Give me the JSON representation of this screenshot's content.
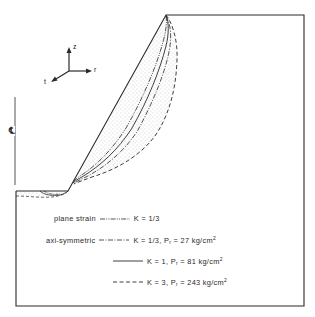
{
  "figure": {
    "type": "cross-section diagram",
    "axes_triad": {
      "z_label": "z",
      "r_label": "r",
      "t_label": "t"
    },
    "centerline_label": "℄",
    "legend": [
      {
        "category": "plane strain",
        "line_style": "dash-dot-dot",
        "k_text": "K = ",
        "k_value": "1/3",
        "pressure_symbol": "",
        "pressure_value": ""
      },
      {
        "category": "axi-symmetric",
        "line_style": "dash-dot",
        "k_text": "K = ",
        "k_value": "1/3",
        "pressure_symbol": "P",
        "pressure_sub": "r",
        "pressure_value": " = 27 kg/cm",
        "pressure_unit_sup": "2"
      },
      {
        "category": "",
        "line_style": "solid",
        "k_text": "K = ",
        "k_value": "1",
        "pressure_symbol": "P",
        "pressure_sub": "r",
        "pressure_value": " = 81 kg/cm",
        "pressure_unit_sup": "2"
      },
      {
        "category": "",
        "line_style": "dashed",
        "k_text": "K = ",
        "k_value": "3",
        "pressure_symbol": "P",
        "pressure_sub": "r",
        "pressure_value": " = 243 kg/cm",
        "pressure_unit_sup": "2"
      }
    ],
    "colors": {
      "line": "#2a2a2a",
      "stipple": "#9a9a9a",
      "background": "#ffffff"
    }
  }
}
